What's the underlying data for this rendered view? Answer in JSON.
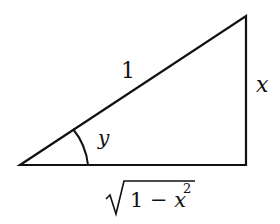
{
  "diagram": {
    "type": "right-triangle",
    "vertices": {
      "bottom_left": [
        20,
        165
      ],
      "bottom_right": [
        246,
        165
      ],
      "top_right": [
        246,
        16
      ]
    },
    "labels": {
      "hypotenuse": "1",
      "vertical_side": "x",
      "angle": "y",
      "base_radical_body": "1 − x",
      "base_exponent": "2"
    },
    "stroke_color": "#111111"
  }
}
